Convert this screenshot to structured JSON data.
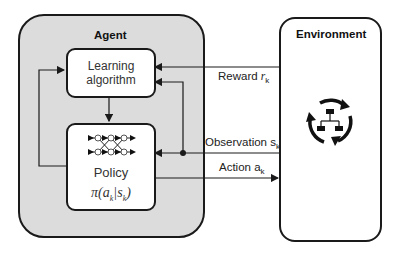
{
  "agent": {
    "title": "Agent",
    "learning_algorithm": {
      "line1": "Learning",
      "line2": "algorithm"
    },
    "policy": {
      "label": "Policy",
      "formula": "π(a_k|s_k)",
      "formula_pi": "π(a",
      "formula_k1": "k",
      "formula_mid": "|s",
      "formula_k2": "k",
      "formula_end": ")"
    }
  },
  "environment": {
    "title": "Environment",
    "icon": "cycle-hierarchy-icon"
  },
  "signals": {
    "reward": {
      "text": "Reward ",
      "var": "r",
      "sub": "k"
    },
    "observation": {
      "text": "Observation s",
      "sub": "k"
    },
    "action": {
      "text": "Action a",
      "sub": "k"
    }
  },
  "colors": {
    "agent_fill": "#dcdcdc",
    "stroke": "#1a1a1a",
    "box_fill": "#ffffff"
  }
}
